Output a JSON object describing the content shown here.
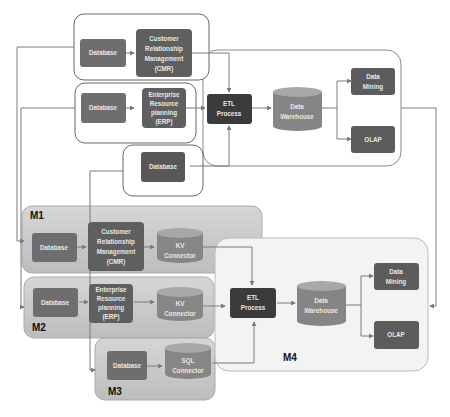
{
  "diagram": {
    "top": {
      "crm_group": {
        "database": "Database",
        "crm": [
          "Customer",
          "Relationship",
          "Management",
          "(CMR)"
        ]
      },
      "erp_group": {
        "database": "Database",
        "erp": [
          "Enterprise",
          "Resource",
          "planning",
          "(ERP)"
        ]
      },
      "db_group": {
        "database": "Database"
      },
      "etl": [
        "ETL",
        "Process"
      ],
      "warehouse": [
        "Data",
        "Warehouse"
      ],
      "mining": [
        "Data",
        "Mining"
      ],
      "olap": [
        "OLAP"
      ]
    },
    "bottom": {
      "m1": {
        "label": "M1",
        "database": "Database",
        "crm": [
          "Customer",
          "Relationship",
          "Management",
          "(CMR)"
        ],
        "connector": [
          "KV",
          "Connector"
        ]
      },
      "m2": {
        "label": "M2",
        "database": "Database",
        "erp": [
          "Enterprise",
          "Resource",
          "planning",
          "(ERP)"
        ],
        "connector": [
          "KV",
          "Connector"
        ]
      },
      "m3": {
        "label": "M3",
        "database": "Database",
        "connector": [
          "SQL",
          "Connector"
        ]
      },
      "m4": {
        "label": "M4",
        "etl": [
          "ETL",
          "Process"
        ],
        "warehouse": [
          "Data",
          "Warehouse"
        ],
        "mining": [
          "Data",
          "Mining"
        ],
        "olap": [
          "OLAP"
        ]
      }
    },
    "colors": {
      "node": "#6f6f6f",
      "node_dark": "#3c3c3c",
      "cylinder": "#8a8a8a",
      "cylinder_top": "#a9a9a9",
      "module_fill": "#cfcfcf",
      "m4_fill": "#f2f2f2",
      "line": "#7a7a7a"
    }
  }
}
